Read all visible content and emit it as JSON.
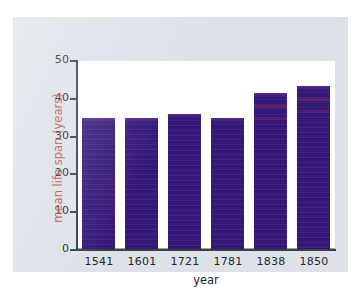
{
  "chart_data": {
    "type": "bar",
    "title": "",
    "xlabel": "year",
    "ylabel": "mean life span (years)",
    "categories": [
      "1541",
      "1601",
      "1721",
      "1781",
      "1838",
      "1850"
    ],
    "values": [
      35,
      35,
      36,
      35,
      41.5,
      43.5
    ],
    "ylim": [
      0,
      50
    ],
    "yticks": [
      0,
      10,
      20,
      30,
      40,
      50
    ],
    "ytick_labels": [
      "0",
      "10",
      "20",
      "30",
      "40",
      "50"
    ],
    "grid": false,
    "legend": null,
    "series": [
      {
        "name": "mean life span",
        "values": [
          35,
          35,
          36,
          35,
          41.5,
          43.5
        ]
      }
    ],
    "colors": {
      "bar": "#35197a",
      "bar_cap": "#5b2a86",
      "axis": "#3a3f4a",
      "ylabel_text": "#c0574c",
      "tick_text": "#22262e",
      "plot_background": "#ffffff",
      "panel_background": "#dde2e9",
      "page_background": "#ffffff"
    }
  }
}
